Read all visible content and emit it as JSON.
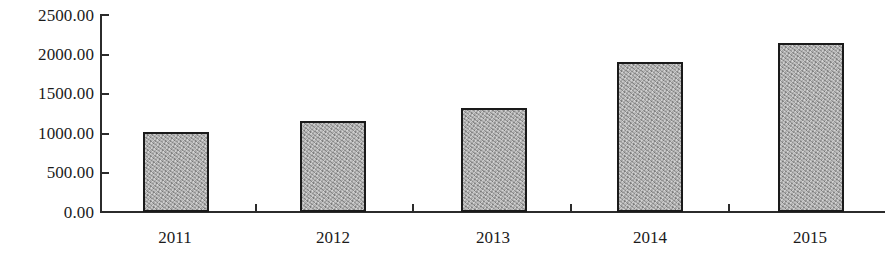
{
  "chart_data": {
    "type": "bar",
    "title": "",
    "subtitle": "",
    "xlabel": "",
    "ylabel": "",
    "categories": [
      "2011",
      "2012",
      "2013",
      "2014",
      "2015"
    ],
    "values": [
      1010.0,
      1155.0,
      1320.0,
      1900.0,
      2140.0
    ],
    "ylim": [
      0,
      2500
    ],
    "ytick_values": [
      2500,
      2000,
      1500,
      1000,
      500,
      0
    ],
    "ytick_labels": [
      "2500.00",
      "2000.00",
      "1500.00",
      "1000.00",
      "500.00",
      "0.00"
    ],
    "grid": false,
    "legend": null,
    "legend_position": "none",
    "annotations": [],
    "series": [
      {
        "name": "",
        "values": [
          1010.0,
          1155.0,
          1320.0,
          1900.0,
          2140.0
        ]
      }
    ],
    "bar_fill_color": "#a9a9a9",
    "bar_border_color": "#1a1a1a",
    "axis_color": "#2b2b2b",
    "background_color": "#ffffff"
  }
}
